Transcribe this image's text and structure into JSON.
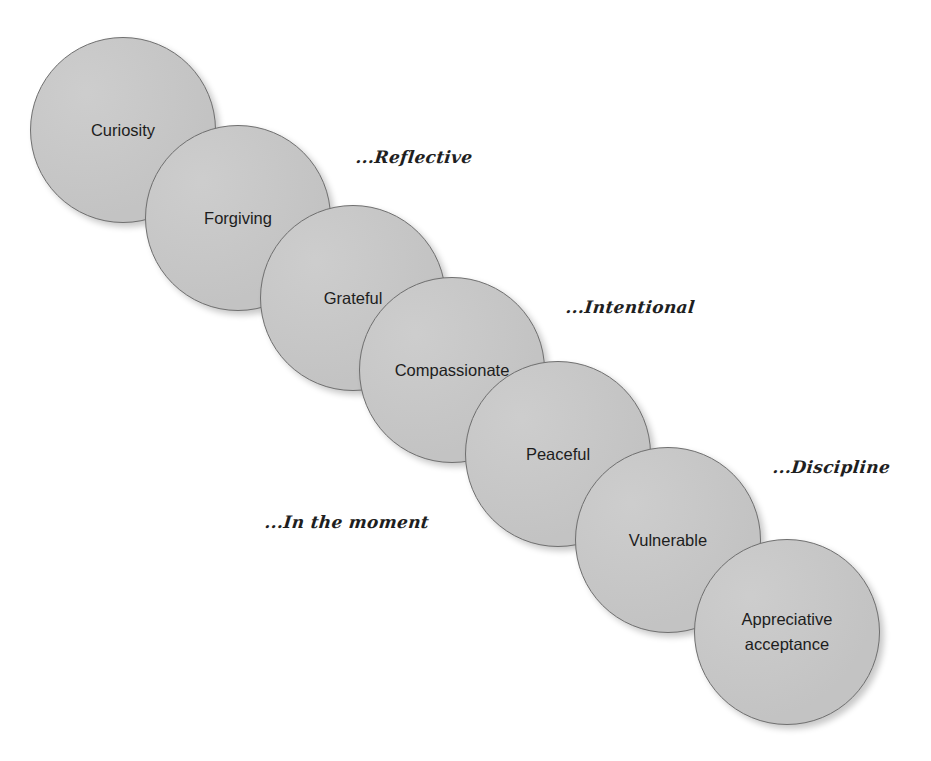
{
  "diagram": {
    "type": "overlapping-circle-sequence",
    "circles": [
      {
        "label": "Curiosity",
        "cx": 123,
        "cy": 130,
        "r": 93
      },
      {
        "label": "Forgiving",
        "cx": 238,
        "cy": 218,
        "r": 93
      },
      {
        "label": "Grateful",
        "cx": 353,
        "cy": 298,
        "r": 93
      },
      {
        "label": "Compassionate",
        "cx": 452,
        "cy": 370,
        "r": 93
      },
      {
        "label": "Peaceful",
        "cx": 558,
        "cy": 454,
        "r": 93
      },
      {
        "label": "Vulnerable",
        "cx": 668,
        "cy": 540,
        "r": 93
      },
      {
        "label": "Appreciative\nacceptance",
        "cx": 787,
        "cy": 632,
        "r": 93
      }
    ],
    "annotations": [
      {
        "text": "...Reflective",
        "x": 356,
        "y": 147
      },
      {
        "text": "...Intentional",
        "x": 566,
        "y": 297
      },
      {
        "text": "...Discipline",
        "x": 773,
        "y": 457
      },
      {
        "text": "...In the moment",
        "x": 265,
        "y": 512
      }
    ],
    "colors": {
      "circle_fill": "#c9c9c9",
      "circle_border": "#6f6f6f",
      "text": "#1d1d1d",
      "background": "#ffffff"
    }
  }
}
